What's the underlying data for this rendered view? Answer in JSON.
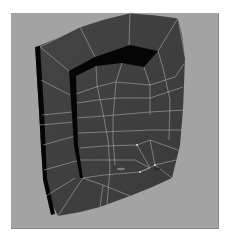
{
  "viewport": {
    "background": "#a3a3a3",
    "frame": {
      "x": 11,
      "y": 13,
      "w": 208,
      "h": 216
    }
  },
  "mesh": {
    "face_color": "#444444",
    "face_color_shade": "#3a3a3a",
    "rim_color": "#050505",
    "wire_color": "#b8b8b8",
    "silhouette": "36,47 60,37 80,27 105,19 130,13 155,15 178,18 182,35 185,57 184,85 183,110 180,145 172,178 150,188 130,196 100,207 80,212 58,216 50,200 44,178 41,150 39,110 37,80",
    "left_edge_strip": "35,47 40,46 44,110 47,178 55,214 51,215 43,180 39,110",
    "rim_top": "69,71 95,57 130,45 158,51 144,67 122,63 96,66 76,76",
    "rim_vertical": "69,71 76,76 78,145 83,178 80,178 74,146",
    "wire_lines": [
      "40,47 60,37 80,27 105,19 130,13",
      "130,13 155,15 178,18",
      "80,27 95,57",
      "130,13 129,45",
      "178,18 158,51",
      "178,18 185,57",
      "40,47 69,71",
      "41,80 70,95",
      "96,66 97,85 104,118 108,140 110,168 107,204",
      "122,63 116,82 113,118 113,140 115,165",
      "144,67 150,85 150,115",
      "158,51 163,68 170,100 169,140",
      "76,94 96,87 116,82 150,85 175,77 184,64",
      "42,115 73,112",
      "77,103 97,100 116,98 150,98 183,87",
      "77,118 104,116 150,112 184,110",
      "40,125 74,122",
      "78,133 104,132 150,130 183,130",
      "43,145 75,136",
      "80,148 104,146 137,145 150,140 178,150",
      "80,160 108,160 135,160 150,168",
      "44,170 80,160",
      "83,178 104,175 140,172 155,165 176,160",
      "83,178 75,190 58,216",
      "83,178 103,185 130,196",
      "155,165 172,178",
      "150,140 155,165",
      "137,145 150,168 140,172",
      "46,196 75,178",
      "100,207 103,185"
    ],
    "vertices_highlight": [
      {
        "x": 137,
        "y": 145
      },
      {
        "x": 155,
        "y": 165
      },
      {
        "x": 140,
        "y": 172
      }
    ],
    "smudges": [
      {
        "x": 121,
        "y": 169,
        "rx": 4,
        "ry": 1.2,
        "color": "#7a7a7a"
      },
      {
        "x": 157,
        "y": 169,
        "rx": 3,
        "ry": 1.5,
        "color": "#2a2a2a"
      }
    ]
  }
}
